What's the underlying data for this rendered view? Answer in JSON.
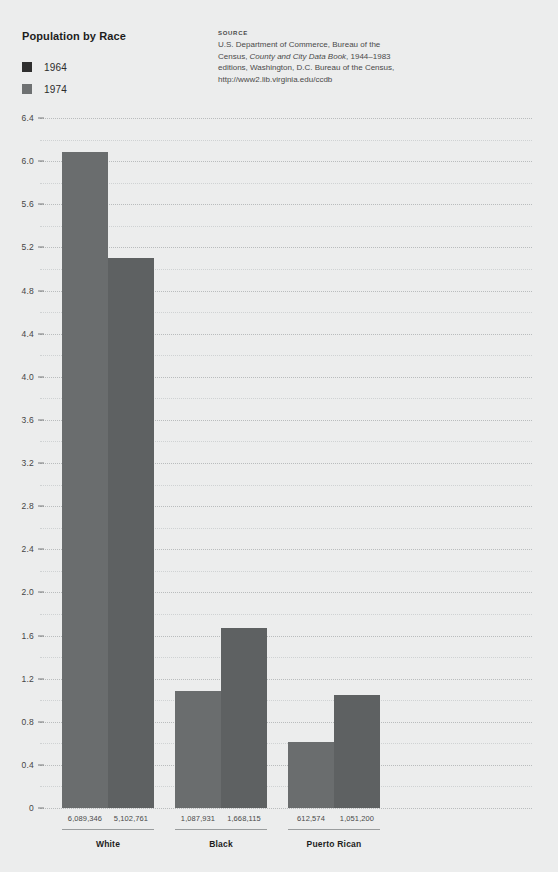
{
  "header": {
    "title": "Population by Race"
  },
  "legend": {
    "items": [
      {
        "label": "1964",
        "color": "#2f2f2f"
      },
      {
        "label": "1974",
        "color": "#6e7172"
      }
    ]
  },
  "source": {
    "heading": "SOURCE",
    "line1": "U.S. Department of Commerce, Bureau of the",
    "line2_pre": "Census, ",
    "line2_italic": "County and City Data Book",
    "line2_post": ", 1944–1983",
    "line3": "editions, Washington, D.C. Bureau of the Census,",
    "line4": "http://www2.lib.virginia.edu/ccdb"
  },
  "chart_data": {
    "type": "bar",
    "title": "Population by Race",
    "xlabel": "",
    "ylabel": "",
    "ylim": [
      0,
      6.4
    ],
    "y_unit": "millions",
    "grid": true,
    "legend_position": "top-left",
    "y_ticks": [
      "0",
      "0.4",
      "0.8",
      "1.2",
      "1.6",
      "2.0",
      "2.4",
      "2.8",
      "3.2",
      "3.6",
      "4.0",
      "4.4",
      "4.8",
      "5.2",
      "5.6",
      "6.0",
      "6.4"
    ],
    "y_tick_values": [
      0,
      0.4,
      0.8,
      1.2,
      1.6,
      2.0,
      2.4,
      2.8,
      3.2,
      3.6,
      4.0,
      4.4,
      4.8,
      5.2,
      5.6,
      6.0,
      6.4
    ],
    "y_minor_step": 0.2,
    "categories": [
      "White",
      "Black",
      "Puerto Rican"
    ],
    "series": [
      {
        "name": "1964",
        "color": "#6a6d6e",
        "values": [
          6.089346,
          1.087931,
          0.612574
        ],
        "value_labels": [
          "6,089,346",
          "1,087,931",
          "612,574"
        ]
      },
      {
        "name": "1974",
        "color": "#5e6162",
        "values": [
          5.102761,
          1.668115,
          1.0512
        ],
        "value_labels": [
          "5,102,761",
          "1,668,115",
          "1,051,200"
        ]
      }
    ]
  },
  "colors": {
    "background": "#eceded",
    "bar_1964": "#6a6d6e",
    "bar_1974": "#5e6162",
    "gridline": "#b9bcbd",
    "text": "#3a3a3a"
  }
}
